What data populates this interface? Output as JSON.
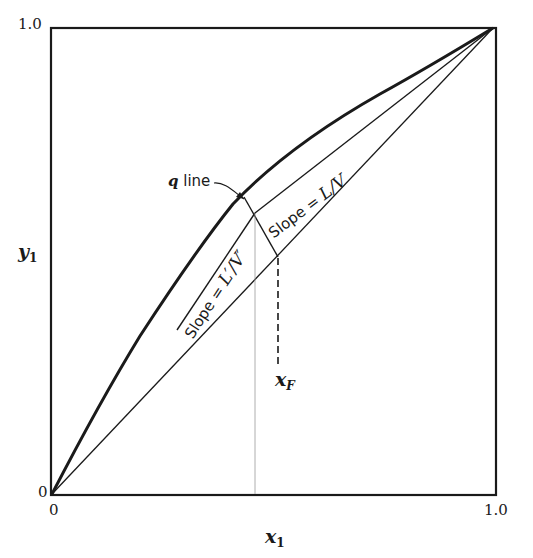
{
  "diagram": {
    "axes": {
      "x_label_var": "x",
      "x_label_sub": "1",
      "y_label_var": "y",
      "y_label_sub": "1",
      "x_ticks": [
        "0",
        "1.0"
      ],
      "y_ticks": [
        "0",
        "1.0"
      ]
    },
    "annotations": {
      "q_line_label_q": "q",
      "q_line_label_text": " line",
      "feed_label_var": "x",
      "feed_label_sub": "F",
      "rectifying_slope_prefix": "Slope = ",
      "rectifying_slope_value": "L/V",
      "stripping_slope_prefix": "Slope = ",
      "stripping_slope_value": "L′/V′"
    },
    "elements": [
      "equilibrium-curve",
      "diagonal-line",
      "rectifying-operating-line",
      "stripping-operating-line",
      "q-line",
      "feed-composition-dashed-line"
    ],
    "colors": {
      "ink": "#1a1a1a",
      "background": "#ffffff"
    }
  }
}
